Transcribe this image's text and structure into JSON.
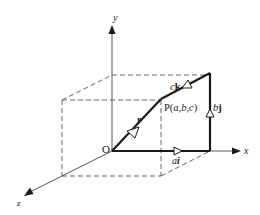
{
  "diagram": {
    "type": "3d-vector-decomposition",
    "colors": {
      "ink": "#1a1a1a",
      "axis": "#444444",
      "dashed": "#555555",
      "background": "#ffffff"
    },
    "axes": {
      "x_label": "x",
      "y_label": "y",
      "z_label": "z"
    },
    "origin_label": "O",
    "point_label": {
      "prefix": "P(",
      "a": "a",
      "sep1": ",",
      "b": "b",
      "sep2": ",",
      "c": "c",
      "suffix": ")"
    },
    "vectors": {
      "r": "r",
      "ai_coef": "a",
      "ai_unit": "i",
      "bj_coef": "b",
      "bj_unit": "j",
      "ck_coef": "c",
      "ck_unit": "k"
    }
  }
}
